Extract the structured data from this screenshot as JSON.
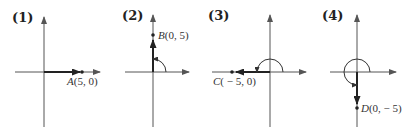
{
  "panels": [
    {
      "number": "(1)",
      "point": {
        "letter": "A",
        "coords": "(5, 0)",
        "x": 5,
        "y": 0
      },
      "angle_deg": 0
    },
    {
      "number": "(2)",
      "point": {
        "letter": "B",
        "coords": "(0, 5)",
        "x": 0,
        "y": 5
      },
      "angle_deg": 90
    },
    {
      "number": "(3)",
      "point": {
        "letter": "C",
        "coords": "( − 5, 0)",
        "x": -5,
        "y": 0
      },
      "angle_deg": 180
    },
    {
      "number": "(4)",
      "point": {
        "letter": "D",
        "coords": "(0, − 5)",
        "x": 0,
        "y": -5
      },
      "angle_deg": 270
    }
  ],
  "colors": {
    "axis": "#555555",
    "vector": "#222222"
  }
}
